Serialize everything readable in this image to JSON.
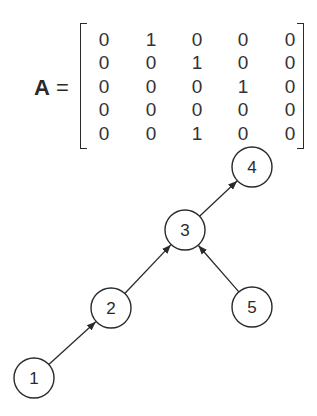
{
  "matrix": {
    "symbol": "A",
    "equals": "=",
    "rows": [
      [
        0,
        1,
        0,
        0,
        0
      ],
      [
        0,
        0,
        1,
        0,
        0
      ],
      [
        0,
        0,
        0,
        1,
        0
      ],
      [
        0,
        0,
        0,
        0,
        0
      ],
      [
        0,
        0,
        1,
        0,
        0
      ]
    ]
  },
  "graph": {
    "nodes": [
      {
        "id": "1",
        "label": "1",
        "x": 34,
        "y": 378
      },
      {
        "id": "2",
        "label": "2",
        "x": 111,
        "y": 308
      },
      {
        "id": "3",
        "label": "3",
        "x": 185,
        "y": 230
      },
      {
        "id": "4",
        "label": "4",
        "x": 252,
        "y": 167
      },
      {
        "id": "5",
        "label": "5",
        "x": 252,
        "y": 307
      }
    ],
    "edges": [
      {
        "from": "1",
        "to": "2"
      },
      {
        "from": "2",
        "to": "3"
      },
      {
        "from": "3",
        "to": "4"
      },
      {
        "from": "5",
        "to": "3"
      }
    ],
    "node_radius": 20,
    "stroke_color": "#2a2a2a"
  }
}
